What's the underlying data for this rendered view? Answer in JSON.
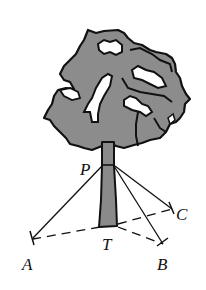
{
  "diagram": {
    "colors": {
      "foliage": "#8c8c8c",
      "trunk": "#8a8a8a",
      "outline": "#111111",
      "background": "#ffffff"
    },
    "labels": {
      "P": "P",
      "T": "T",
      "A": "A",
      "B": "B",
      "C": "C"
    },
    "points": {
      "P": [
        108,
        165
      ],
      "T": [
        107,
        227
      ],
      "A": [
        33,
        238
      ],
      "B": [
        163,
        244
      ],
      "C": [
        172,
        209
      ]
    },
    "solid_segments": [
      [
        "P",
        "A"
      ],
      [
        "P",
        "B"
      ],
      [
        "P",
        "C"
      ]
    ],
    "dashed_segments": [
      [
        "T",
        "A"
      ],
      [
        "T",
        "B"
      ],
      [
        "T",
        "C"
      ]
    ]
  }
}
